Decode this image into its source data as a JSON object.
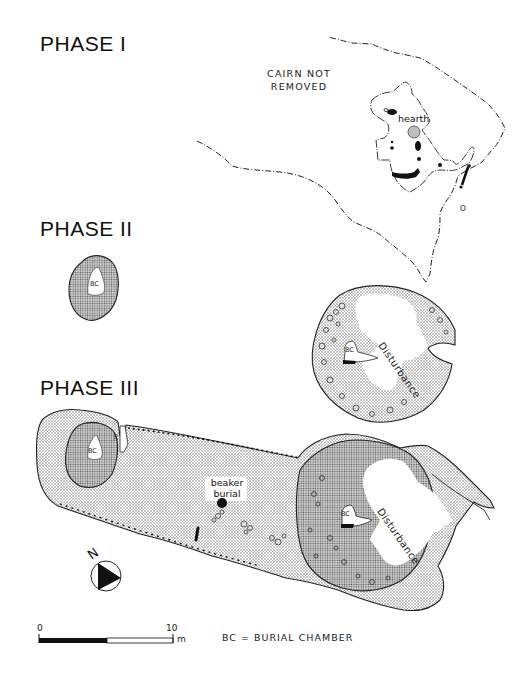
{
  "phases": [
    {
      "title": "PHASE I"
    },
    {
      "title": "PHASE II"
    },
    {
      "title": "PHASE III"
    }
  ],
  "phase1": {
    "cairn_note_line1": "CAIRN NOT",
    "cairn_note_line2": "REMOVED",
    "hearth_label": "hearth"
  },
  "phase2": {
    "bc_label": "BC"
  },
  "phase3_upper": {
    "bc_label": "BC",
    "disturbance_label": "Disturbance"
  },
  "phase3": {
    "bc_label_west": "BC",
    "bc_label_side": "BC",
    "bc_label_east": "BC",
    "beaker_line1": "beaker",
    "beaker_line2": "burial",
    "disturbance_label": "Disturbance"
  },
  "north_arrow": {
    "label": "N"
  },
  "scale_bar": {
    "start": "0",
    "end": "10",
    "unit": "m"
  },
  "legend": {
    "text": "BC = BURIAL CHAMBER"
  },
  "colors": {
    "ink": "#111111",
    "stipple": "#8a8a8a",
    "paper": "#ffffff"
  }
}
